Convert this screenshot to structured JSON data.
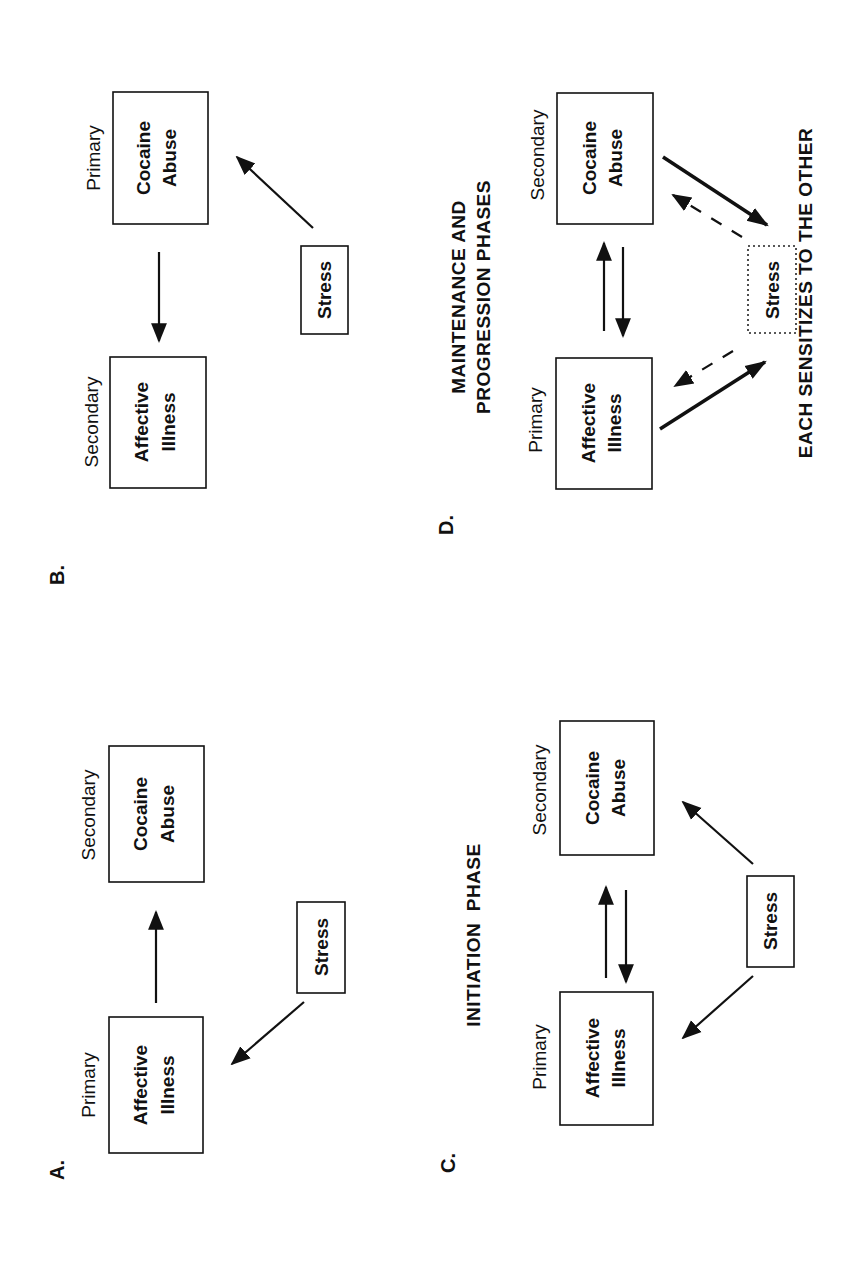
{
  "figure": {
    "panels": {
      "A": {
        "letter": "A.",
        "primary_label": "Primary",
        "secondary_label": "Secondary",
        "primary_box": [
          "Affective",
          "Illness"
        ],
        "secondary_box": [
          "Cocaine",
          "Abuse"
        ],
        "stress_box": "Stress"
      },
      "B": {
        "letter": "B.",
        "primary_label": "Primary",
        "secondary_label": "Secondary",
        "primary_box": [
          "Cocaine",
          "Abuse"
        ],
        "secondary_box": [
          "Affective",
          "Illness"
        ],
        "stress_box": "Stress"
      },
      "C": {
        "letter": "C.",
        "title": "INITIATION  PHASE",
        "primary_label": "Primary",
        "secondary_label": "Secondary",
        "primary_box": [
          "Affective",
          "Illness"
        ],
        "secondary_box": [
          "Cocaine",
          "Abuse"
        ],
        "stress_box": "Stress"
      },
      "D": {
        "letter": "D.",
        "title": [
          "MAINTENANCE AND",
          "PROGRESSION PHASES"
        ],
        "primary_label": "Primary",
        "secondary_label": "Secondary",
        "primary_box": [
          "Affective",
          "Illness"
        ],
        "secondary_box": [
          "Cocaine",
          "Abuse"
        ],
        "stress_box": "Stress",
        "caption": "EACH SENSITIZES TO THE OTHER"
      }
    },
    "colors": {
      "ink": "#111111",
      "background": "#ffffff"
    }
  }
}
